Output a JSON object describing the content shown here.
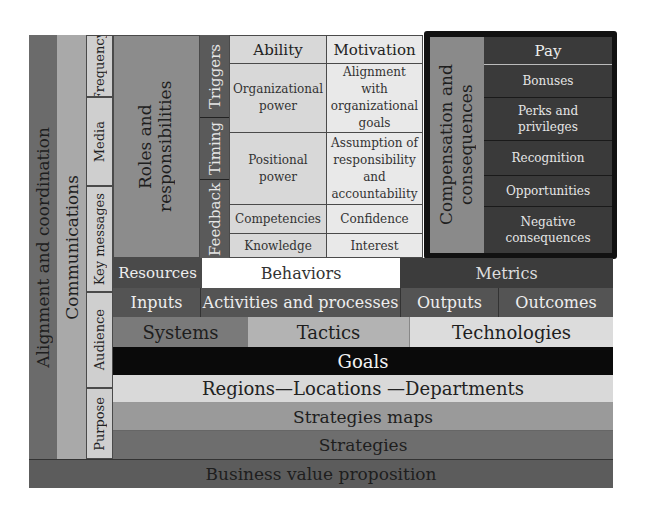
{
  "colors": {
    "alignment": "#6b6b6b",
    "communications": "#a9a9a9",
    "comm_sub": "#cfcfcf",
    "roles": "#8c8c8c",
    "triggers_col": "#5a5a5a",
    "ability_grid": "#d8d8d8",
    "motivation_grid": "#e9e9e9",
    "comp_border": "#111111",
    "comp_label": "#8a8a8a",
    "comp_panel": "#3a3a3a",
    "resources": "#4a4a4a",
    "behaviors": "#ffffff",
    "metrics": "#3c3c3c",
    "io_row": "#545454",
    "systems": "#7a7a7a",
    "tactics": "#b3b3b3",
    "technologies": "#dcdcdc",
    "goals": "#0a0a0a",
    "regions": "#d9d9d9",
    "strategies_maps": "#9a9a9a",
    "strategies": "#6e6e6e",
    "bvp": "#5c5c5c"
  },
  "left_columns": {
    "alignment": "Alignment and coordination",
    "communications": "Communications",
    "comm_items": [
      "Frequency",
      "Media",
      "Key messages",
      "Audience",
      "Purpose"
    ],
    "roles": "Roles and responsibilities"
  },
  "triggers_column": [
    "Triggers",
    "Timing",
    "Feedback"
  ],
  "grid": {
    "headers": [
      "Ability",
      "Motivation"
    ],
    "rows": [
      [
        "Organizational power",
        "Alignment with organizational goals"
      ],
      [
        "Positional power",
        "Assumption of responsibility and accountability"
      ],
      [
        "Competencies",
        "Confidence"
      ],
      [
        "Knowledge",
        "Interest"
      ]
    ]
  },
  "compensation": {
    "label": "Compensation and consequences",
    "items": [
      "Pay",
      "Bonuses",
      "Perks and privileges",
      "Recognition",
      "Opportunities",
      "Negative consequences"
    ]
  },
  "rows": {
    "resources": "Resources",
    "behaviors": "Behaviors",
    "metrics": "Metrics",
    "inputs": "Inputs",
    "activities": "Activities and processes",
    "outputs": "Outputs",
    "outcomes": "Outcomes",
    "systems": "Systems",
    "tactics": "Tactics",
    "technologies": "Technologies",
    "goals": "Goals",
    "regions": "Regions—Locations —Departments",
    "strategies_maps": "Strategies maps",
    "strategies": "Strategies",
    "bvp": "Business value proposition"
  }
}
